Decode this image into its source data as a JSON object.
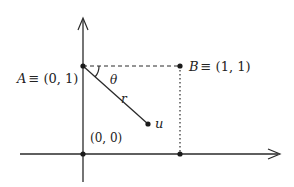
{
  "diagram": {
    "points": {
      "A": {
        "label_name": "A",
        "label_eq": "≡ (0, 1)"
      },
      "B": {
        "label_name": "B",
        "label_eq": "≡ (1, 1)"
      },
      "origin": {
        "label": "(0, 0)"
      },
      "u": {
        "label": "u"
      }
    },
    "angle_label": "θ",
    "segment_label": "r",
    "colors": {
      "ink": "#2a2a2a"
    }
  }
}
